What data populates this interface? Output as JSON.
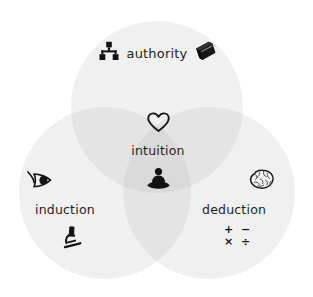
{
  "diagram": {
    "type": "venn",
    "title": "",
    "background_color": "#ffffff",
    "circle_fill": "#f0f0f0",
    "overlap_fill": "#e2e2e2",
    "center_fill": "#d8d8d8",
    "text_color": "#1f1f1f",
    "sets": [
      {
        "id": "authority",
        "label": "authority",
        "position": "top",
        "icons": [
          "org-chart-icon",
          "book-icon"
        ]
      },
      {
        "id": "induction",
        "label": "induction",
        "position": "bottom-left",
        "icons": [
          "eye-icon",
          "microscope-icon"
        ]
      },
      {
        "id": "deduction",
        "label": "deduction",
        "position": "bottom-right",
        "icons": [
          "brain-icon",
          "math-operators-icon"
        ],
        "math_operators": {
          "row1": "+  −",
          "row2": "×  ÷"
        }
      }
    ],
    "intersection": {
      "id": "intuition",
      "label": "intuition",
      "position": "center",
      "icons": [
        "heart-icon",
        "meditation-icon"
      ]
    }
  }
}
